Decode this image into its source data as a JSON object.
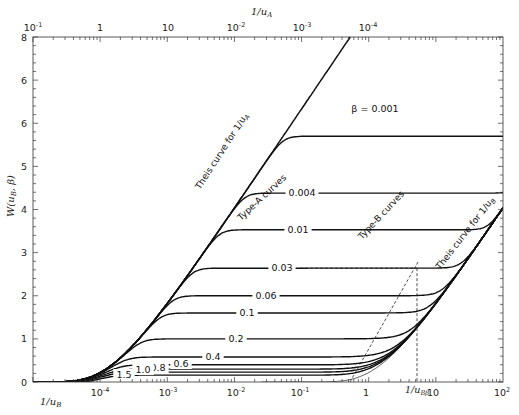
{
  "chart_data": {
    "type": "line",
    "title": "",
    "xlabel": "1/u_B",
    "x2label": "1/u_A",
    "ylabel": "W(u_B, β)",
    "xscale": "log",
    "xlim_bottom": [
      1e-05,
      100
    ],
    "xlim_top": [
      0.1,
      1e-05
    ],
    "ylim": [
      0,
      8
    ],
    "grid": false,
    "legend": "none (inline labels)",
    "bottom_ticks": [
      "10^-4",
      "10^-3",
      "10^-2",
      "10^-1",
      "1",
      "10",
      "10^2"
    ],
    "bottom_tick_values": [
      0.0001,
      0.001,
      0.01,
      0.1,
      1,
      10,
      100
    ],
    "top_ticks": [
      "10^-1",
      "1",
      "10",
      "10^-2",
      "10^-3",
      "10^-4"
    ],
    "y_ticks": [
      "0",
      "1",
      "2",
      "3",
      "4",
      "5",
      "6",
      "6",
      "8"
    ],
    "y_tick_values": [
      0,
      1,
      2,
      3,
      4,
      5,
      6,
      7,
      8
    ],
    "series": [
      {
        "name": "β = 0.001",
        "label": "β = 0.001",
        "plateau": 5.7,
        "end_value_at_100": 6.3
      },
      {
        "name": "0.004",
        "label": "0.004",
        "plateau": 4.38,
        "end_value_at_100": 5.7
      },
      {
        "name": "0.01",
        "label": "0.01",
        "plateau": 3.53,
        "end_value_at_100": 5.6
      },
      {
        "name": "0.03",
        "label": "0.03",
        "plateau": 2.64,
        "end_value_at_100": 5.5
      },
      {
        "name": "0.06",
        "label": "0.06",
        "plateau": 2.0,
        "end_value_at_100": 5.45
      },
      {
        "name": "0.1",
        "label": "0.1",
        "plateau": 1.6,
        "end_value_at_100": 5.42
      },
      {
        "name": "0.2",
        "label": "0.2",
        "plateau": 1.0,
        "end_value_at_100": 5.4
      },
      {
        "name": "0.4",
        "label": "0.4",
        "plateau": 0.58,
        "end_value_at_100": 5.38
      },
      {
        "name": "0.6",
        "label": "0.6",
        "plateau": 0.4,
        "end_value_at_100": 5.36
      },
      {
        "name": "0.8",
        "label": "0.8",
        "plateau": 0.3,
        "end_value_at_100": 5.35
      },
      {
        "name": "1.0",
        "label": "1.0",
        "plateau": 0.23,
        "end_value_at_100": 5.34
      },
      {
        "name": "1.5",
        "label": "1.5",
        "plateau": 0.16,
        "end_value_at_100": 5.33
      }
    ],
    "annotations": [
      "Theis curve for 1/u_A",
      "Theis curve for 1/u_B",
      "Type-A curves",
      "Type-B curves",
      "1/u_Bβ"
    ],
    "reference_lines": {
      "dashed_horizontal_at_y": 2.64,
      "dashed_vertical_at_x_label": "1/u_Bβ",
      "dashed_vertical_x": 5,
      "dashed_asymptote": "from ~0.45 on 1/u_B axis rising to Theis B curve"
    }
  },
  "axes": {
    "bottom_title": "1/u",
    "bottom_title_sub": "B",
    "top_title": "1/u",
    "top_title_sub": "A",
    "left_title": "W(u",
    "left_title_sub": "B",
    "left_title_tail": ", β)",
    "bottom_labels": [
      {
        "base": "10",
        "exp": "-4",
        "x": 100
      },
      {
        "base": "10",
        "exp": "-3",
        "x": 168
      },
      {
        "base": "10",
        "exp": "-2",
        "x": 236
      },
      {
        "base": "10",
        "exp": "-1",
        "x": 300
      },
      {
        "base": "1",
        "exp": "",
        "x": 366
      },
      {
        "base": "10",
        "exp": "",
        "x": 433
      },
      {
        "base": "10",
        "exp": "2",
        "x": 502
      }
    ],
    "top_labels": [
      {
        "base": "10",
        "exp": "-1",
        "x": 33
      },
      {
        "base": "1",
        "exp": "",
        "x": 100
      },
      {
        "base": "10",
        "exp": "",
        "x": 168
      },
      {
        "base": "10",
        "exp": "-2",
        "x": 236
      },
      {
        "base": "10",
        "exp": "-3",
        "x": 302
      },
      {
        "base": "10",
        "exp": "-4",
        "x": 368
      }
    ],
    "left_labels": [
      "0",
      "1",
      "2",
      "3",
      "4",
      "5",
      "6",
      "6",
      "8"
    ],
    "ubb_label": "1/u",
    "ubb_sub": "Bβ"
  },
  "labels": {
    "theis_a": "Theis curve for 1/u",
    "theis_a_sub": "A",
    "theis_b": "Theis curve for 1/u",
    "theis_b_sub": "B",
    "type_a": "Type-A curves",
    "type_b": "Type-B curves"
  }
}
